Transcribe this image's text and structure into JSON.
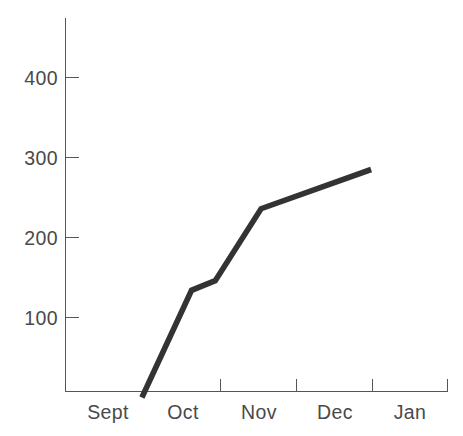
{
  "chart_data": {
    "type": "line",
    "title": "",
    "subtitle": "",
    "xlabel": "",
    "ylabel": "",
    "grid": false,
    "legend": "none",
    "axis_color": "#555555",
    "line_color": "#333333",
    "label_color": "#4a4a4a",
    "background": "#ffffff",
    "x_categories": [
      "Sept",
      "Oct",
      "Nov",
      "Dec",
      "Jan"
    ],
    "x_tick_values": [
      "",
      "",
      "",
      "",
      ""
    ],
    "y_tick_labels": [
      "100",
      "200",
      "300",
      "400"
    ],
    "y_tick_values": [
      100,
      200,
      300,
      400
    ],
    "ylim": [
      0,
      460
    ],
    "xlim": [
      0,
      5
    ],
    "series": [
      {
        "name": "",
        "points": [
          {
            "x": 1.0,
            "y": 0
          },
          {
            "x": 1.65,
            "y": 134
          },
          {
            "x": 1.96,
            "y": 146
          },
          {
            "x": 2.56,
            "y": 236
          },
          {
            "x": 4.0,
            "y": 285
          }
        ]
      }
    ]
  },
  "axes": {
    "y_labels": [
      {
        "text": "400",
        "value": 400
      },
      {
        "text": "300",
        "value": 300
      },
      {
        "text": "200",
        "value": 200
      },
      {
        "text": "100",
        "value": 100
      }
    ],
    "x_labels": [
      {
        "text": "Sept"
      },
      {
        "text": "Oct"
      },
      {
        "text": "Nov"
      },
      {
        "text": "Dec"
      },
      {
        "text": "Jan"
      }
    ]
  }
}
